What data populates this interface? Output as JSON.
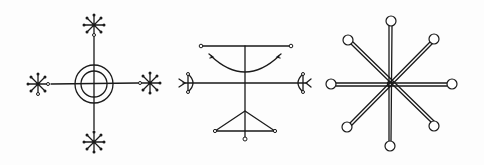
{
  "figure": {
    "ink_color": "#1a1a1a",
    "background_color": "#fdfdfd",
    "symbols": [
      {
        "name": "cross-with-concentric-circles-and-asterisks",
        "center": [
          94,
          84
        ],
        "outer_circle_radius": 19,
        "inner_circle_radius": 13,
        "asterisk_centers": [
          [
            94,
            25
          ],
          [
            38,
            84
          ],
          [
            150,
            83
          ],
          [
            94,
            142
          ]
        ]
      },
      {
        "name": "cross-with-arc-bows-and-triangle",
        "vertical_axis_x": 245,
        "top_bar_y": 46,
        "middle_bar_y": 83,
        "triangle_base_y": 131
      },
      {
        "name": "eight-spoked-star-with-ring-terminals",
        "center": [
          390,
          84
        ],
        "spoke_count": 8,
        "terminal_circle_radius": 5
      }
    ]
  }
}
